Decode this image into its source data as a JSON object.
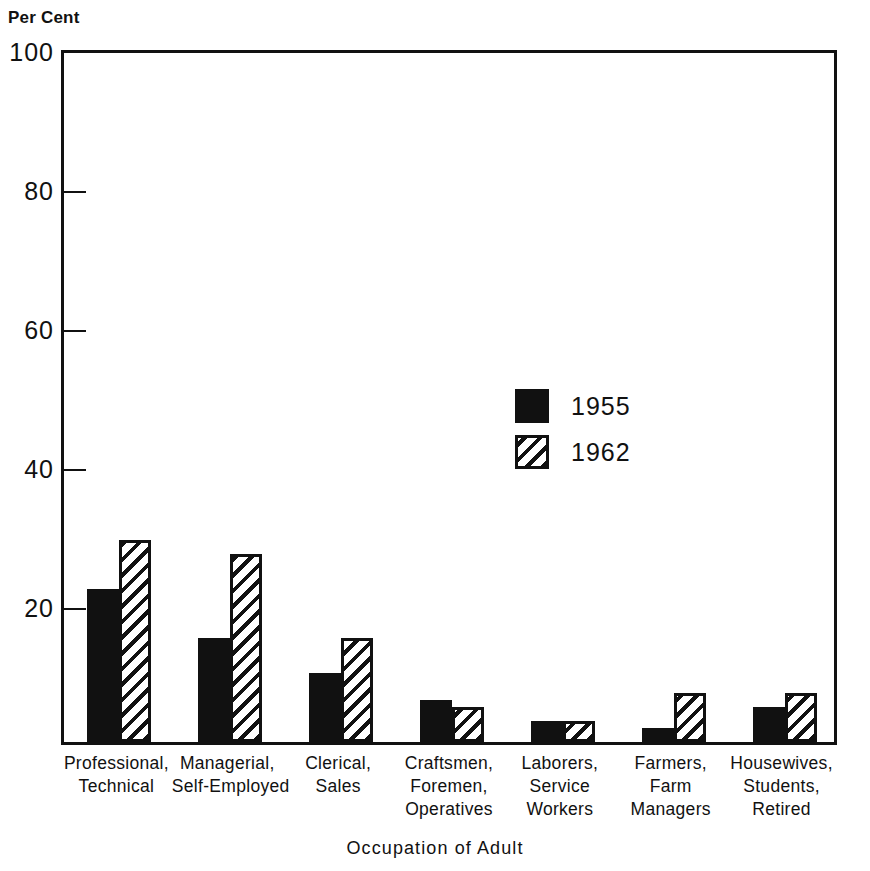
{
  "chart_data": {
    "type": "bar",
    "title": "",
    "ylabel": "Per Cent",
    "xlabel": "Occupation of Adult",
    "ylim": [
      0,
      100
    ],
    "yticks": [
      100,
      80,
      60,
      40,
      20
    ],
    "grid": false,
    "legend_position": "inside-center-right",
    "categories": [
      "Professional, Technical",
      "Managerial, Self-Employed",
      "Clerical, Sales",
      "Craftsmen, Foremen, Operatives",
      "Laborers, Service Workers",
      "Farmers, Farm Managers",
      "Housewives, Students, Retired"
    ],
    "category_lines": [
      [
        "Professional,",
        "Technical"
      ],
      [
        "Managerial,",
        "Self-Employed"
      ],
      [
        "Clerical,",
        "Sales"
      ],
      [
        "Craftsmen,",
        "Foremen,",
        "Operatives"
      ],
      [
        "Laborers,",
        "Service",
        "Workers"
      ],
      [
        "Farmers,",
        "Farm",
        "Managers"
      ],
      [
        "Housewives,",
        "Students,",
        "Retired"
      ]
    ],
    "series": [
      {
        "name": "1955",
        "style": "solid",
        "color": "#111111",
        "values": [
          22,
          15,
          10,
          6,
          3,
          2,
          5
        ]
      },
      {
        "name": "1962",
        "style": "diagonal-hatch",
        "color": "#111111",
        "values": [
          29,
          27,
          15,
          5,
          3,
          7,
          7
        ]
      }
    ]
  },
  "legend": {
    "items": [
      {
        "label": "1955",
        "style": "solid"
      },
      {
        "label": "1962",
        "style": "hatch"
      }
    ]
  },
  "axis": {
    "y_title": "Per Cent",
    "x_title": "Occupation of Adult",
    "y_tick_labels": [
      "100",
      "80",
      "60",
      "40",
      "20"
    ]
  }
}
